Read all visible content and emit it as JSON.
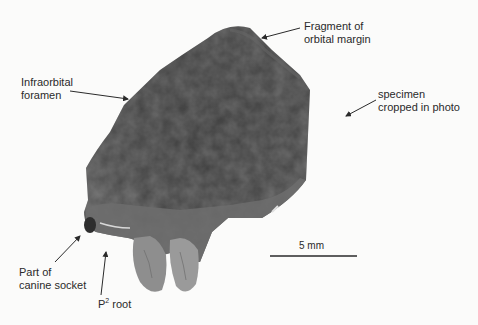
{
  "figure": {
    "annotations": [
      {
        "id": "orbital",
        "lines": [
          "Fragment of",
          "orbital margin"
        ]
      },
      {
        "id": "infraorbital",
        "lines": [
          "Infraorbital",
          "foramen"
        ]
      },
      {
        "id": "cropped",
        "lines": [
          "specimen",
          "cropped in photo"
        ]
      },
      {
        "id": "canine",
        "lines": [
          "Part of",
          "canine socket"
        ]
      },
      {
        "id": "p2",
        "prefix": "P",
        "superscript": "2",
        "suffix": " root"
      }
    ],
    "scale_bar": {
      "label": "5 mm"
    },
    "colors": {
      "specimen_dark": "#3e3e3e",
      "specimen_mid": "#5a5a5a",
      "specimen_light": "#9a9a9a",
      "text": "#2a2a2a",
      "background": "#fbfbfa"
    }
  }
}
